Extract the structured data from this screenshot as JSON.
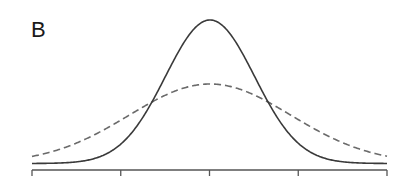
{
  "panel": {
    "label": "B"
  },
  "chart_data": {
    "type": "line",
    "title": "",
    "xlabel": "",
    "ylabel": "",
    "x_ticks": 5,
    "tick_labels": [],
    "series": [
      {
        "name": "narrow distribution (solid)",
        "style": "solid",
        "color": "#333333",
        "center": 0,
        "sigma": 1.0,
        "peak_rel": 1.0
      },
      {
        "name": "wide distribution (dashed)",
        "style": "dashed",
        "color": "#666666",
        "center": 0,
        "sigma": 1.82,
        "peak_rel": 0.55
      }
    ],
    "grid": false,
    "legend": null
  },
  "geometry": {
    "cx": 210,
    "base_y": 163.5,
    "x_min": 32,
    "x_max": 387,
    "axis_y": 170,
    "tick_len": 6,
    "solid": {
      "amp": 143.5,
      "sigma_px": 44.6
    },
    "dashed": {
      "amp": 79.5,
      "sigma_px": 81
    }
  }
}
